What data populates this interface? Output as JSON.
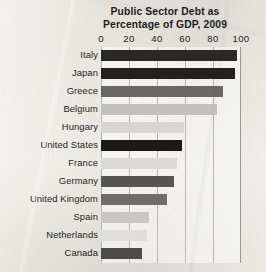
{
  "chart_data": {
    "type": "bar",
    "orientation": "horizontal",
    "title": "Public Sector Debt as Percentage of GDP, 2009",
    "title_lines": [
      "Public Sector Debt as",
      "Percentage of GDP, 2009"
    ],
    "xlabel": "",
    "ylabel": "",
    "xlim": [
      0,
      100
    ],
    "xticks": [
      0,
      20,
      40,
      60,
      80,
      100
    ],
    "xtick_labels": [
      "0",
      "20",
      "40",
      "60",
      "80",
      "100"
    ],
    "grid": true,
    "grid_axis": "x",
    "legend": false,
    "categories": [
      "Italy",
      "Japan",
      "Greece",
      "Belgium",
      "Hungary",
      "United States",
      "France",
      "Germany",
      "United Kingdom",
      "Spain",
      "Netherlands",
      "Canada"
    ],
    "values": [
      97,
      96,
      87,
      83,
      59,
      58,
      54,
      52,
      47,
      34,
      33,
      29
    ],
    "bar_colors": [
      "#2a2826",
      "#232120",
      "#6a6864",
      "#c3c1bd",
      "#d8d6d2",
      "#1a1918",
      "#dcdad6",
      "#575552",
      "#6f6d69",
      "#c9c7c3",
      "#e0deda",
      "#4d4b48"
    ]
  },
  "axis": {
    "tick_0": "0",
    "tick_20": "20",
    "tick_40": "40",
    "tick_60": "60",
    "tick_80": "80",
    "tick_100": "100"
  }
}
